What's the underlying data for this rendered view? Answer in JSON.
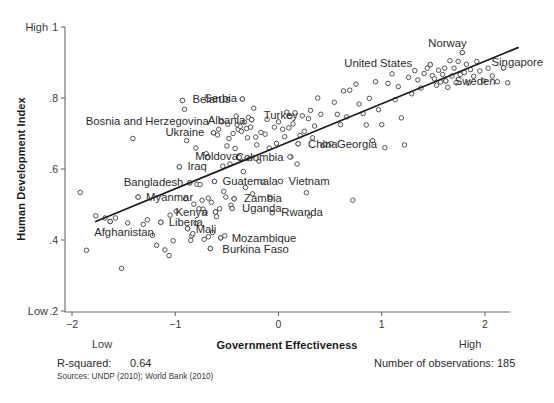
{
  "chart_data": {
    "type": "scatter",
    "title": "",
    "xlabel": "Government Effectiveness",
    "ylabel": "Human Development Index",
    "xlim": [
      -2.25,
      2.25
    ],
    "ylim": [
      0.2,
      1.0
    ],
    "grid": false,
    "legend": "none",
    "x_ticks": [
      "-2",
      "-1",
      "0",
      "1",
      "2"
    ],
    "x_tick_values": [
      -2,
      -1,
      0,
      1,
      2
    ],
    "y_ticks": [
      "1",
      ".8",
      ".6",
      ".4",
      ".2"
    ],
    "y_tick_values": [
      1,
      0.8,
      0.6,
      0.4,
      0.2
    ],
    "axis_extremes": {
      "y_high": "High",
      "y_low": "Low",
      "x_low": "Low",
      "x_high": "High"
    },
    "fit_line": {
      "x0": -1.77,
      "y0": 0.452,
      "x1": 2.32,
      "y1": 0.942
    },
    "r_squared": "0.64",
    "n_observations": "185",
    "labeled_points": [
      {
        "name": "Belarus",
        "x": -0.93,
        "y": 0.793,
        "dx": 10,
        "dy": 3
      },
      {
        "name": "Serbia",
        "x": -0.35,
        "y": 0.797,
        "dx": -38,
        "dy": 3
      },
      {
        "name": "Bosnia and Herzegovina",
        "x": -0.55,
        "y": 0.733,
        "dx": -136,
        "dy": 3
      },
      {
        "name": "Albania",
        "x": -0.26,
        "y": 0.739,
        "dx": -44,
        "dy": 4
      },
      {
        "name": "Turkey",
        "x": 0.11,
        "y": 0.748,
        "dx": -26,
        "dy": 3
      },
      {
        "name": "Ukraine",
        "x": -0.63,
        "y": 0.702,
        "dx": -48,
        "dy": 3
      },
      {
        "name": "China",
        "x": 0.19,
        "y": 0.671,
        "dx": 10,
        "dy": 4
      },
      {
        "name": "Georgia",
        "x": 0.45,
        "y": 0.67,
        "dx": 12,
        "dy": 4
      },
      {
        "name": "Moldova",
        "x": -0.38,
        "y": 0.633,
        "dx": -44,
        "dy": 3
      },
      {
        "name": "Colombia",
        "x": 0.11,
        "y": 0.634,
        "dx": -54,
        "dy": 4
      },
      {
        "name": "Iraq",
        "x": -0.96,
        "y": 0.606,
        "dx": 8,
        "dy": 3
      },
      {
        "name": "Bangladesh",
        "x": -0.86,
        "y": 0.561,
        "dx": -66,
        "dy": 3
      },
      {
        "name": "Guatemala",
        "x": -0.62,
        "y": 0.565,
        "dx": 8,
        "dy": 4
      },
      {
        "name": "Vietnam",
        "x": 0.02,
        "y": 0.565,
        "dx": 8,
        "dy": 4
      },
      {
        "name": "Myanmar",
        "x": -1.36,
        "y": 0.521,
        "dx": 8,
        "dy": 4
      },
      {
        "name": "Zambia",
        "x": -0.43,
        "y": 0.516,
        "dx": 10,
        "dy": 3
      },
      {
        "name": "Uganda",
        "x": -0.45,
        "y": 0.489,
        "dx": 10,
        "dy": 4
      },
      {
        "name": "Kenya",
        "x": -0.61,
        "y": 0.479,
        "dx": -40,
        "dy": 4
      },
      {
        "name": "Rwanda",
        "x": -0.06,
        "y": 0.477,
        "dx": 9,
        "dy": 3
      },
      {
        "name": "Afghanistan",
        "x": -1.63,
        "y": 0.452,
        "dx": -16,
        "dy": 14
      },
      {
        "name": "Liberia",
        "x": -1.14,
        "y": 0.45,
        "dx": 8,
        "dy": 4
      },
      {
        "name": "Mali",
        "x": -0.88,
        "y": 0.432,
        "dx": 8,
        "dy": 4
      },
      {
        "name": "Mozambique",
        "x": -0.56,
        "y": 0.406,
        "dx": 11,
        "dy": 4
      },
      {
        "name": "Burkina Faso",
        "x": -0.66,
        "y": 0.376,
        "dx": 12,
        "dy": 4
      },
      {
        "name": "United States",
        "x": 1.47,
        "y": 0.894,
        "dx": -86,
        "dy": 2
      },
      {
        "name": "Norway",
        "x": 1.78,
        "y": 0.928,
        "dx": -34,
        "dy": -6
      },
      {
        "name": "Singapore",
        "x": 2.18,
        "y": 0.885,
        "dx": -12,
        "dy": -2
      },
      {
        "name": "Sweden",
        "x": 1.62,
        "y": 0.848,
        "dx": 9,
        "dy": 4
      }
    ],
    "points": [
      {
        "x": -1.92,
        "y": 0.534
      },
      {
        "x": -1.86,
        "y": 0.371
      },
      {
        "x": -1.77,
        "y": 0.468
      },
      {
        "x": -1.68,
        "y": 0.462
      },
      {
        "x": -1.63,
        "y": 0.452
      },
      {
        "x": -1.58,
        "y": 0.462
      },
      {
        "x": -1.52,
        "y": 0.32
      },
      {
        "x": -1.46,
        "y": 0.448
      },
      {
        "x": -1.41,
        "y": 0.686
      },
      {
        "x": -1.36,
        "y": 0.521
      },
      {
        "x": -1.31,
        "y": 0.444
      },
      {
        "x": -1.27,
        "y": 0.457
      },
      {
        "x": -1.22,
        "y": 0.413
      },
      {
        "x": -1.18,
        "y": 0.385
      },
      {
        "x": -1.14,
        "y": 0.45
      },
      {
        "x": -1.1,
        "y": 0.372
      },
      {
        "x": -1.06,
        "y": 0.356
      },
      {
        "x": -1.02,
        "y": 0.398
      },
      {
        "x": -0.99,
        "y": 0.481
      },
      {
        "x": -0.96,
        "y": 0.606
      },
      {
        "x": -0.93,
        "y": 0.793
      },
      {
        "x": -0.91,
        "y": 0.768
      },
      {
        "x": -0.89,
        "y": 0.68
      },
      {
        "x": -0.88,
        "y": 0.432
      },
      {
        "x": -0.86,
        "y": 0.561
      },
      {
        "x": -0.85,
        "y": 0.399
      },
      {
        "x": -0.84,
        "y": 0.412
      },
      {
        "x": -0.83,
        "y": 0.418
      },
      {
        "x": -0.82,
        "y": 0.501
      },
      {
        "x": -0.8,
        "y": 0.659
      },
      {
        "x": -0.79,
        "y": 0.557
      },
      {
        "x": -0.77,
        "y": 0.488
      },
      {
        "x": -0.76,
        "y": 0.556
      },
      {
        "x": -0.74,
        "y": 0.512
      },
      {
        "x": -0.73,
        "y": 0.487
      },
      {
        "x": -0.71,
        "y": 0.478
      },
      {
        "x": -0.7,
        "y": 0.643
      },
      {
        "x": -0.69,
        "y": 0.632
      },
      {
        "x": -0.68,
        "y": 0.518
      },
      {
        "x": -0.66,
        "y": 0.376
      },
      {
        "x": -0.65,
        "y": 0.506
      },
      {
        "x": -0.63,
        "y": 0.702
      },
      {
        "x": -0.62,
        "y": 0.565
      },
      {
        "x": -0.61,
        "y": 0.479
      },
      {
        "x": -0.6,
        "y": 0.466
      },
      {
        "x": -0.59,
        "y": 0.696
      },
      {
        "x": -0.58,
        "y": 0.712
      },
      {
        "x": -0.57,
        "y": 0.488
      },
      {
        "x": -0.56,
        "y": 0.406
      },
      {
        "x": -0.55,
        "y": 0.733
      },
      {
        "x": -0.54,
        "y": 0.608
      },
      {
        "x": -0.53,
        "y": 0.537
      },
      {
        "x": -0.52,
        "y": 0.412
      },
      {
        "x": -0.51,
        "y": 0.521
      },
      {
        "x": -0.5,
        "y": 0.665
      },
      {
        "x": -0.49,
        "y": 0.726
      },
      {
        "x": -0.48,
        "y": 0.686
      },
      {
        "x": -0.47,
        "y": 0.614
      },
      {
        "x": -0.46,
        "y": 0.498
      },
      {
        "x": -0.45,
        "y": 0.489
      },
      {
        "x": -0.44,
        "y": 0.7
      },
      {
        "x": -0.43,
        "y": 0.516
      },
      {
        "x": -0.42,
        "y": 0.658
      },
      {
        "x": -0.41,
        "y": 0.749
      },
      {
        "x": -0.4,
        "y": 0.724
      },
      {
        "x": -0.39,
        "y": 0.712
      },
      {
        "x": -0.38,
        "y": 0.633
      },
      {
        "x": -0.37,
        "y": 0.72
      },
      {
        "x": -0.36,
        "y": 0.706
      },
      {
        "x": -0.35,
        "y": 0.797
      },
      {
        "x": -0.34,
        "y": 0.593
      },
      {
        "x": -0.33,
        "y": 0.732
      },
      {
        "x": -0.32,
        "y": 0.548
      },
      {
        "x": -0.31,
        "y": 0.714
      },
      {
        "x": -0.3,
        "y": 0.688
      },
      {
        "x": -0.29,
        "y": 0.745
      },
      {
        "x": -0.28,
        "y": 0.629
      },
      {
        "x": -0.27,
        "y": 0.718
      },
      {
        "x": -0.26,
        "y": 0.739
      },
      {
        "x": -0.25,
        "y": 0.53
      },
      {
        "x": -0.24,
        "y": 0.771
      },
      {
        "x": -0.22,
        "y": 0.69
      },
      {
        "x": -0.21,
        "y": 0.668
      },
      {
        "x": -0.19,
        "y": 0.622
      },
      {
        "x": -0.17,
        "y": 0.703
      },
      {
        "x": -0.15,
        "y": 0.563
      },
      {
        "x": -0.13,
        "y": 0.698
      },
      {
        "x": -0.11,
        "y": 0.74
      },
      {
        "x": -0.09,
        "y": 0.659
      },
      {
        "x": -0.08,
        "y": 0.52
      },
      {
        "x": -0.06,
        "y": 0.477
      },
      {
        "x": -0.04,
        "y": 0.718
      },
      {
        "x": -0.02,
        "y": 0.672
      },
      {
        "x": 0.0,
        "y": 0.733
      },
      {
        "x": 0.02,
        "y": 0.565
      },
      {
        "x": 0.04,
        "y": 0.712
      },
      {
        "x": 0.06,
        "y": 0.691
      },
      {
        "x": 0.08,
        "y": 0.76
      },
      {
        "x": 0.1,
        "y": 0.716
      },
      {
        "x": 0.11,
        "y": 0.748
      },
      {
        "x": 0.12,
        "y": 0.634
      },
      {
        "x": 0.14,
        "y": 0.727
      },
      {
        "x": 0.16,
        "y": 0.758
      },
      {
        "x": 0.18,
        "y": 0.614
      },
      {
        "x": 0.19,
        "y": 0.671
      },
      {
        "x": 0.21,
        "y": 0.694
      },
      {
        "x": 0.23,
        "y": 0.75
      },
      {
        "x": 0.25,
        "y": 0.706
      },
      {
        "x": 0.27,
        "y": 0.533
      },
      {
        "x": 0.29,
        "y": 0.742
      },
      {
        "x": 0.31,
        "y": 0.765
      },
      {
        "x": 0.33,
        "y": 0.688
      },
      {
        "x": 0.35,
        "y": 0.721
      },
      {
        "x": 0.38,
        "y": 0.8
      },
      {
        "x": 0.41,
        "y": 0.754
      },
      {
        "x": 0.43,
        "y": 0.666
      },
      {
        "x": 0.45,
        "y": 0.67
      },
      {
        "x": 0.48,
        "y": 0.668
      },
      {
        "x": 0.51,
        "y": 0.672
      },
      {
        "x": 0.54,
        "y": 0.788
      },
      {
        "x": 0.57,
        "y": 0.754
      },
      {
        "x": 0.6,
        "y": 0.725
      },
      {
        "x": 0.63,
        "y": 0.82
      },
      {
        "x": 0.66,
        "y": 0.747
      },
      {
        "x": 0.69,
        "y": 0.822
      },
      {
        "x": 0.72,
        "y": 0.512
      },
      {
        "x": 0.75,
        "y": 0.839
      },
      {
        "x": 0.78,
        "y": 0.783
      },
      {
        "x": 0.82,
        "y": 0.756
      },
      {
        "x": 0.85,
        "y": 0.724
      },
      {
        "x": 0.88,
        "y": 0.799
      },
      {
        "x": 0.91,
        "y": 0.68
      },
      {
        "x": 0.94,
        "y": 0.846
      },
      {
        "x": 0.97,
        "y": 0.767
      },
      {
        "x": 1.0,
        "y": 0.725
      },
      {
        "x": 1.03,
        "y": 0.66
      },
      {
        "x": 1.06,
        "y": 0.841
      },
      {
        "x": 1.1,
        "y": 0.868
      },
      {
        "x": 1.13,
        "y": 0.795
      },
      {
        "x": 1.16,
        "y": 0.832
      },
      {
        "x": 1.19,
        "y": 0.744
      },
      {
        "x": 1.22,
        "y": 0.668
      },
      {
        "x": 1.26,
        "y": 0.858
      },
      {
        "x": 1.29,
        "y": 0.812
      },
      {
        "x": 1.32,
        "y": 0.877
      },
      {
        "x": 1.35,
        "y": 0.851
      },
      {
        "x": 1.38,
        "y": 0.828
      },
      {
        "x": 1.41,
        "y": 0.869
      },
      {
        "x": 1.44,
        "y": 0.884
      },
      {
        "x": 1.47,
        "y": 0.894
      },
      {
        "x": 1.49,
        "y": 0.863
      },
      {
        "x": 1.51,
        "y": 0.854
      },
      {
        "x": 1.53,
        "y": 0.836
      },
      {
        "x": 1.55,
        "y": 0.878
      },
      {
        "x": 1.57,
        "y": 0.845
      },
      {
        "x": 1.59,
        "y": 0.866
      },
      {
        "x": 1.61,
        "y": 0.884
      },
      {
        "x": 1.62,
        "y": 0.848
      },
      {
        "x": 1.64,
        "y": 0.83
      },
      {
        "x": 1.66,
        "y": 0.905
      },
      {
        "x": 1.68,
        "y": 0.862
      },
      {
        "x": 1.7,
        "y": 0.884
      },
      {
        "x": 1.72,
        "y": 0.843
      },
      {
        "x": 1.74,
        "y": 0.903
      },
      {
        "x": 1.76,
        "y": 0.866
      },
      {
        "x": 1.78,
        "y": 0.928
      },
      {
        "x": 1.8,
        "y": 0.872
      },
      {
        "x": 1.82,
        "y": 0.895
      },
      {
        "x": 1.84,
        "y": 0.842
      },
      {
        "x": 1.86,
        "y": 0.88
      },
      {
        "x": 1.89,
        "y": 0.861
      },
      {
        "x": 1.92,
        "y": 0.903
      },
      {
        "x": 1.95,
        "y": 0.876
      },
      {
        "x": 1.99,
        "y": 0.848
      },
      {
        "x": 2.03,
        "y": 0.884
      },
      {
        "x": 2.07,
        "y": 0.862
      },
      {
        "x": 2.12,
        "y": 0.846
      },
      {
        "x": 2.18,
        "y": 0.885
      },
      {
        "x": 2.22,
        "y": 0.843
      },
      {
        "x": 0.3,
        "y": 0.468
      },
      {
        "x": -0.8,
        "y": 0.447
      },
      {
        "x": -1.05,
        "y": 0.47
      },
      {
        "x": -0.72,
        "y": 0.402
      },
      {
        "x": -0.68,
        "y": 0.409
      },
      {
        "x": -0.64,
        "y": 0.421
      },
      {
        "x": -0.9,
        "y": 0.516
      }
    ]
  },
  "footer": {
    "rsquared_label": "R-squared:",
    "rsquared_value": "0.64",
    "sources": "Sources: UNDP (2010); World Bank (2010)",
    "observations": "Number of observations: 185"
  }
}
